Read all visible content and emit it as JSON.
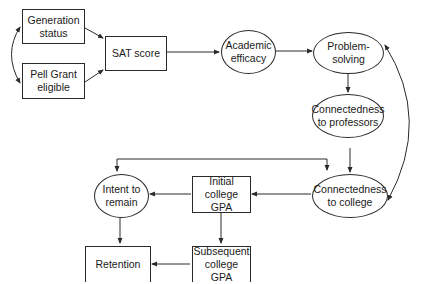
{
  "diagram": {
    "type": "path-model",
    "nodes": [
      {
        "id": "generation_status",
        "label": "Generation\nstatus",
        "shape": "rect"
      },
      {
        "id": "pell_grant",
        "label": "Pell Grant\neligible",
        "shape": "rect"
      },
      {
        "id": "sat_score",
        "label": "SAT score",
        "shape": "rect"
      },
      {
        "id": "academic_efficacy",
        "label": "Academic\nefficacy",
        "shape": "ellipse"
      },
      {
        "id": "problem_solving",
        "label": "Problem-\nsolving",
        "shape": "ellipse"
      },
      {
        "id": "conn_professors",
        "label": "Connectedness\nto professors",
        "shape": "ellipse"
      },
      {
        "id": "conn_college",
        "label": "Connectedness\nto college",
        "shape": "ellipse"
      },
      {
        "id": "initial_gpa",
        "label": "Initial college\nGPA",
        "shape": "rect"
      },
      {
        "id": "intent_remain",
        "label": "Intent to\nremain",
        "shape": "ellipse"
      },
      {
        "id": "subsequent_gpa",
        "label": "Subsequent\ncollege GPA",
        "shape": "rect"
      },
      {
        "id": "retention",
        "label": "Retention",
        "shape": "rect"
      }
    ],
    "edges": [
      {
        "from": "generation_status",
        "to": "pell_grant",
        "type": "bidirectional-curved"
      },
      {
        "from": "generation_status",
        "to": "sat_score"
      },
      {
        "from": "pell_grant",
        "to": "sat_score"
      },
      {
        "from": "sat_score",
        "to": "academic_efficacy"
      },
      {
        "from": "academic_efficacy",
        "to": "problem_solving"
      },
      {
        "from": "problem_solving",
        "to": "conn_professors"
      },
      {
        "from": "conn_professors",
        "to": "conn_college"
      },
      {
        "from": "problem_solving",
        "to": "conn_college",
        "type": "bidirectional-curved"
      },
      {
        "from": "conn_college",
        "to": "initial_gpa"
      },
      {
        "from": "initial_gpa",
        "to": "intent_remain"
      },
      {
        "from": "initial_gpa",
        "to": "subsequent_gpa"
      },
      {
        "from": "intent_remain",
        "to": "retention"
      },
      {
        "from": "subsequent_gpa",
        "to": "retention"
      },
      {
        "from": "intent_remain",
        "to": "conn_college",
        "type": "bidirectional-elbow"
      }
    ]
  },
  "labels": {
    "generation_status": "Generation\nstatus",
    "pell_grant": "Pell Grant\neligible",
    "sat_score": "SAT score",
    "academic_efficacy": "Academic\nefficacy",
    "problem_solving": "Problem-\nsolving",
    "conn_professors": "Connectedness\nto professors",
    "conn_college": "Connectedness\nto college",
    "initial_gpa": "Initial college\nGPA",
    "intent_remain": "Intent to\nremain",
    "subsequent_gpa": "Subsequent\ncollege GPA",
    "retention": "Retention"
  },
  "colors": {
    "line": "#2a2a2a",
    "background": "#ffffff",
    "text": "#1a1a1a"
  }
}
